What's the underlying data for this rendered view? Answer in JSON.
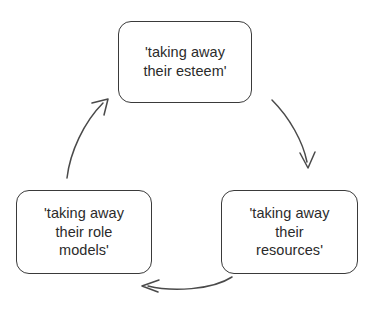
{
  "diagram": {
    "type": "cycle-diagram",
    "background_color": "#ffffff",
    "box_border_color": "#3a3a3a",
    "text_color": "#2b2b2b",
    "arrow_color": "#4a4a4a",
    "nodes": [
      {
        "id": "esteem",
        "position": "top",
        "label": "'taking away\ntheir esteem'",
        "lines": [
          "'taking away",
          "their esteem'"
        ]
      },
      {
        "id": "resources",
        "position": "bottom-right",
        "label": "'taking away\ntheir\nresources'",
        "lines": [
          "'taking away",
          "their",
          "resources'"
        ]
      },
      {
        "id": "role-models",
        "position": "bottom-left",
        "label": "'taking away\ntheir role\nmodels'",
        "lines": [
          "'taking away",
          "their role",
          "models'"
        ]
      }
    ],
    "arrows": [
      {
        "id": "esteem-to-resources",
        "from": "esteem",
        "to": "resources",
        "direction": "clockwise-right",
        "head": "open-v"
      },
      {
        "id": "resources-to-role-models",
        "from": "resources",
        "to": "role-models",
        "direction": "clockwise-bottom",
        "head": "open-v"
      },
      {
        "id": "role-models-to-esteem",
        "from": "role-models",
        "to": "esteem",
        "direction": "clockwise-left",
        "head": "open-v"
      }
    ]
  }
}
